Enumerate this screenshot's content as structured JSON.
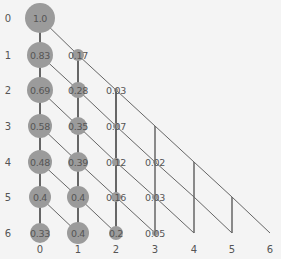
{
  "diagram": {
    "type": "triangular probability lattice",
    "row_labels": [
      "0",
      "1",
      "2",
      "3",
      "4",
      "5",
      "6"
    ],
    "col_labels": [
      "0",
      "1",
      "2",
      "3",
      "4",
      "5",
      "6"
    ],
    "colors": {
      "node": "#9b9b9b",
      "line": "#666666",
      "text": "#555555",
      "background": "#f4f4f4"
    },
    "nodes": [
      {
        "row": 0,
        "col": 0,
        "value": "1.0",
        "r": 15
      },
      {
        "row": 1,
        "col": 0,
        "value": "0.83",
        "r": 13
      },
      {
        "row": 2,
        "col": 0,
        "value": "0.69",
        "r": 13
      },
      {
        "row": 3,
        "col": 0,
        "value": "0.58",
        "r": 12
      },
      {
        "row": 4,
        "col": 0,
        "value": "0.48",
        "r": 12
      },
      {
        "row": 5,
        "col": 0,
        "value": "0.4",
        "r": 11
      },
      {
        "row": 6,
        "col": 0,
        "value": "0.33",
        "r": 10
      },
      {
        "row": 1,
        "col": 1,
        "value": "0.17",
        "r": 6
      },
      {
        "row": 2,
        "col": 1,
        "value": "0.28",
        "r": 8
      },
      {
        "row": 3,
        "col": 1,
        "value": "0.35",
        "r": 9
      },
      {
        "row": 4,
        "col": 1,
        "value": "0.39",
        "r": 10
      },
      {
        "row": 5,
        "col": 1,
        "value": "0.4",
        "r": 11
      },
      {
        "row": 6,
        "col": 1,
        "value": "0.4",
        "r": 11
      },
      {
        "row": 2,
        "col": 2,
        "value": "0.03",
        "r": 2
      },
      {
        "row": 3,
        "col": 2,
        "value": "0.07",
        "r": 3
      },
      {
        "row": 4,
        "col": 2,
        "value": "0.12",
        "r": 4
      },
      {
        "row": 5,
        "col": 2,
        "value": "0.16",
        "r": 5
      },
      {
        "row": 6,
        "col": 2,
        "value": "0.2",
        "r": 7
      },
      {
        "row": 4,
        "col": 3,
        "value": "0.02",
        "r": 2
      },
      {
        "row": 5,
        "col": 3,
        "value": "0.03",
        "r": 3
      },
      {
        "row": 6,
        "col": 3,
        "value": "0.05",
        "r": 3
      }
    ]
  }
}
